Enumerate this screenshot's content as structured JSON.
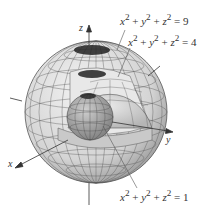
{
  "diagram": {
    "type": "nested-spheres",
    "axes": {
      "x_label": "x",
      "y_label": "y",
      "z_label": "z"
    },
    "surfaces": [
      {
        "equation": "x² + y² + z² = 9",
        "radius": 3,
        "label": {
          "x": "x",
          "y": "y",
          "z": "z",
          "rhs": "9"
        }
      },
      {
        "equation": "x² + y² + z² = 4",
        "radius": 2,
        "label": {
          "x": "x",
          "y": "y",
          "z": "z",
          "rhs": "4"
        }
      },
      {
        "equation": "x² + y² + z² = 1",
        "radius": 1,
        "label": {
          "x": "x",
          "y": "y",
          "z": "z",
          "rhs": "1"
        }
      }
    ],
    "colors": {
      "outer_sphere": "#d9d9d9",
      "middle_sphere": "#c8c8c8",
      "inner_sphere": "#a8a8a8",
      "grid": "#444444",
      "axis": "#333333",
      "text": "#333333"
    }
  }
}
